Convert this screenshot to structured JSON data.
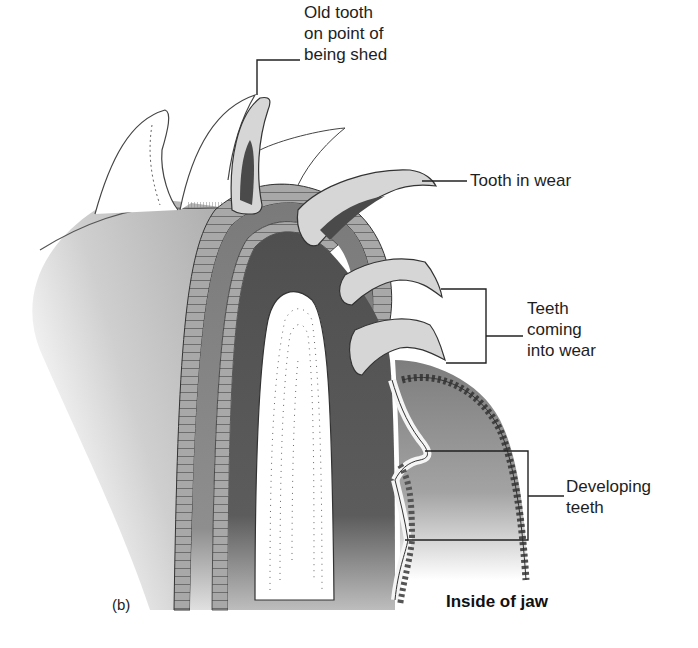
{
  "figure": {
    "panel_letter": "(b)",
    "caption": "Inside of jaw"
  },
  "labels": {
    "old_tooth": {
      "lines": [
        "Old tooth",
        "on point of",
        "being shed"
      ]
    },
    "tooth_in_wear": {
      "lines": [
        "Tooth in wear"
      ]
    },
    "teeth_coming_into_wear": {
      "lines": [
        "Teeth",
        "coming",
        "into wear"
      ]
    },
    "developing_teeth": {
      "lines": [
        "Developing",
        "teeth"
      ]
    }
  },
  "colors": {
    "background": "#ffffff",
    "outline": "#3a3a3a",
    "dark_tissue": "#5e5e5e",
    "mid_tissue": "#8c8c8c",
    "light_tissue": "#c9c9c9",
    "tooth_fill": "#d6d6d6",
    "cartilage": "#ffffff",
    "text": "#1e1e1e"
  }
}
